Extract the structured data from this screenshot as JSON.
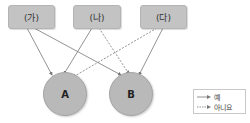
{
  "sources": [
    {
      "id": "ga",
      "label": "(가)"
    },
    {
      "id": "na",
      "label": "(나)"
    },
    {
      "id": "da",
      "label": "(다)"
    }
  ],
  "targets": [
    {
      "id": "A",
      "label": "A"
    },
    {
      "id": "B",
      "label": "B"
    }
  ],
  "edges": [
    {
      "from": "(가)",
      "to": "A",
      "type": "yes"
    },
    {
      "from": "(가)",
      "to": "B",
      "type": "yes"
    },
    {
      "from": "(나)",
      "to": "A",
      "type": "yes"
    },
    {
      "from": "(나)",
      "to": "B",
      "type": "no"
    },
    {
      "from": "(다)",
      "to": "A",
      "type": "no"
    },
    {
      "from": "(다)",
      "to": "B",
      "type": "yes"
    }
  ],
  "legend": {
    "yes_label": "예",
    "no_label": "아니요"
  },
  "colors": {
    "box_fill": "#c3c3c3",
    "node_fill": "#b9b9b9",
    "edge": "#777777"
  }
}
